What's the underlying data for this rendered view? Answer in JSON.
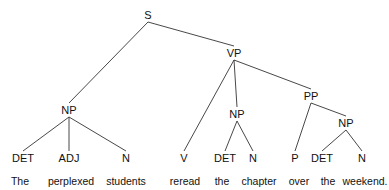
{
  "diagram": {
    "type": "parse-tree",
    "line_color": "#333333",
    "nodes": [
      {
        "id": "S",
        "label": "S",
        "x": 148,
        "y": 9,
        "parent": null
      },
      {
        "id": "NP1",
        "label": "NP",
        "x": 69,
        "y": 104,
        "parent": "S"
      },
      {
        "id": "VP",
        "label": "VP",
        "x": 234,
        "y": 47,
        "parent": "S"
      },
      {
        "id": "DET1",
        "label": "DET",
        "x": 23,
        "y": 152,
        "parent": "NP1"
      },
      {
        "id": "ADJ",
        "label": "ADJ",
        "x": 69,
        "y": 152,
        "parent": "NP1"
      },
      {
        "id": "N1",
        "label": "N",
        "x": 126,
        "y": 152,
        "parent": "NP1"
      },
      {
        "id": "V",
        "label": "V",
        "x": 184,
        "y": 152,
        "parent": "VP"
      },
      {
        "id": "NP2",
        "label": "NP",
        "x": 237,
        "y": 108,
        "parent": "VP"
      },
      {
        "id": "PP",
        "label": "PP",
        "x": 311,
        "y": 90,
        "parent": "VP"
      },
      {
        "id": "DET2",
        "label": "DET",
        "x": 225,
        "y": 152,
        "parent": "NP2"
      },
      {
        "id": "N2",
        "label": "N",
        "x": 253,
        "y": 152,
        "parent": "NP2"
      },
      {
        "id": "P",
        "label": "P",
        "x": 295,
        "y": 152,
        "parent": "PP"
      },
      {
        "id": "NP3",
        "label": "NP",
        "x": 346,
        "y": 117,
        "parent": "PP"
      },
      {
        "id": "DET3",
        "label": "DET",
        "x": 322,
        "y": 152,
        "parent": "NP3"
      },
      {
        "id": "N3",
        "label": "N",
        "x": 362,
        "y": 152,
        "parent": "NP3"
      }
    ],
    "words": [
      {
        "text": "The",
        "x": 20,
        "y": 175
      },
      {
        "text": "perplexed",
        "x": 71,
        "y": 175
      },
      {
        "text": "students",
        "x": 126,
        "y": 175
      },
      {
        "text": "reread",
        "x": 185,
        "y": 175
      },
      {
        "text": "the",
        "x": 222,
        "y": 175
      },
      {
        "text": "chapter",
        "x": 259,
        "y": 175
      },
      {
        "text": "over",
        "x": 299,
        "y": 175
      },
      {
        "text": "the",
        "x": 328,
        "y": 175
      },
      {
        "text": "weekend.",
        "x": 365,
        "y": 175
      }
    ]
  }
}
